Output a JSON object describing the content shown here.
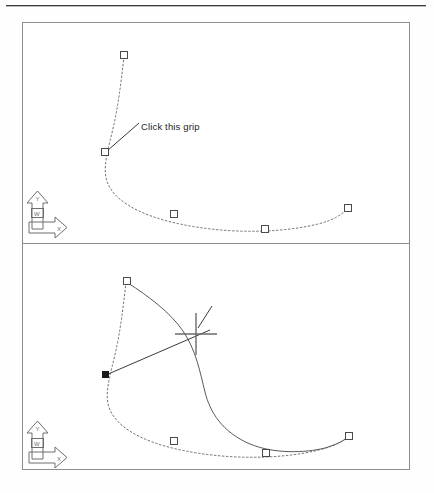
{
  "figure": {
    "type": "cad-illustration",
    "background_color": "#ffffff",
    "frame_color": "#8d8d8d",
    "panel_count": 2
  },
  "panels": [
    {
      "id": "before",
      "name": "top-viewport",
      "callout": {
        "label": "Click this grip",
        "anchor_x": 105,
        "anchor_y": 152
      },
      "ucs_icon": {
        "name": "ucs-icon",
        "x_axis_label": "X",
        "y_axis_label": "Y",
        "world_label": "W"
      },
      "grips": [
        {
          "name": "grip-top",
          "x": 124,
          "y": 55,
          "state": "unselected"
        },
        {
          "name": "grip-upper-left",
          "x": 105,
          "y": 152,
          "state": "unselected"
        },
        {
          "name": "grip-lower-left",
          "x": 174,
          "y": 214,
          "state": "unselected"
        },
        {
          "name": "grip-bottom",
          "x": 265,
          "y": 229,
          "state": "unselected"
        },
        {
          "name": "grip-right",
          "x": 348,
          "y": 208,
          "state": "unselected"
        }
      ],
      "curves": [
        {
          "name": "spline-original",
          "style": "dashed"
        }
      ]
    },
    {
      "id": "after",
      "name": "bottom-viewport",
      "callout": {
        "label": "Move the grip here",
        "anchor_x": 196,
        "anchor_y": 334
      },
      "ucs_icon": {
        "name": "ucs-icon",
        "x_axis_label": "X",
        "y_axis_label": "Y",
        "world_label": "W"
      },
      "crosshair": {
        "name": "crosshair-cursor",
        "x": 196,
        "y": 334
      },
      "grips": [
        {
          "name": "grip-top",
          "x": 127,
          "y": 281,
          "state": "unselected"
        },
        {
          "name": "grip-upper-left",
          "x": 105,
          "y": 375,
          "state": "selected"
        },
        {
          "name": "grip-lower-left",
          "x": 174,
          "y": 441,
          "state": "unselected"
        },
        {
          "name": "grip-bottom",
          "x": 266,
          "y": 453,
          "state": "unselected"
        },
        {
          "name": "grip-right",
          "x": 349,
          "y": 436,
          "state": "unselected"
        }
      ],
      "curves": [
        {
          "name": "spline-original",
          "style": "dashed"
        },
        {
          "name": "spline-stretched",
          "style": "solid"
        }
      ]
    }
  ],
  "colors": {
    "ink": "#1d1d1d",
    "curve_dashed": "#6e6e6e",
    "curve_solid": "#5a5a5a",
    "grip_stroke": "#4a4a4a",
    "grip_selected_fill": "#1a1a1a",
    "frame": "#8d8d8d"
  }
}
